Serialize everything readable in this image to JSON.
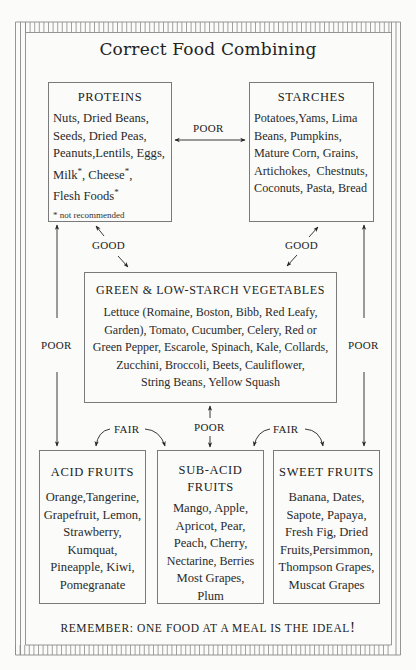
{
  "title": "Correct Food Combining",
  "groups": {
    "proteins": {
      "heading": "PROTEINS",
      "lines": [
        "Nuts, Dried Beans,",
        "Seeds, Dried Peas,",
        "Peanuts,Lentils, Eggs,"
      ],
      "starred": [
        "Milk",
        ", Cheese",
        ","
      ],
      "last": "Flesh Foods",
      "asterisk": "*",
      "note": "* not recommended"
    },
    "starches": {
      "heading": "STARCHES",
      "lines": [
        "Potatoes,Yams, Lima",
        "Beans, Pumpkins,",
        "Mature Corn, Grains,",
        "Artichokes,  Chestnuts,",
        "Coconuts, Pasta, Bread"
      ]
    },
    "vegetables": {
      "heading": "GREEN & LOW-STARCH VEGETABLES",
      "lines": [
        "Lettuce (Romaine, Boston, Bibb, Red Leafy,",
        "Garden), Tomato, Cucumber, Celery, Red or",
        "Green Pepper, Escarole, Spinach, Kale, Collards,",
        "Zucchini, Broccoli, Beets, Cauliflower,",
        "String Beans, Yellow Squash"
      ]
    },
    "acid_fruits": {
      "heading": "ACID FRUITS",
      "lines": [
        "Orange,Tangerine,",
        "Grapefruit, Lemon,",
        "Strawberry,",
        "Kumquat,",
        "Pineapple, Kiwi,",
        "Pomegranate"
      ]
    },
    "sub_acid_fruits": {
      "heading_lines": [
        "SUB-ACID",
        "FRUITS"
      ],
      "lines": [
        "Mango, Apple,",
        "Apricot, Pear,",
        "Peach, Cherry,",
        "Nectarine, Berries",
        "Most Grapes,",
        "Plum"
      ]
    },
    "sweet_fruits": {
      "heading": "SWEET FRUITS",
      "lines": [
        "Banana, Dates,",
        "Sapote, Papaya,",
        "Fresh Fig, Dried",
        "Fruits,Persimmon,",
        "Thompson Grapes,",
        "Muscat Grapes"
      ]
    }
  },
  "relations": {
    "proteins_starches": "POOR",
    "proteins_vegetables": "GOOD",
    "starches_vegetables": "GOOD",
    "proteins_acid": "POOR",
    "starches_sweet": "POOR",
    "vegetables_subacid": "POOR",
    "acid_subacid": "FAIR",
    "subacid_sweet": "FAIR"
  },
  "footer": {
    "text": "REMEMBER: ONE FOOD AT A MEAL IS THE IDEAL",
    "bang": "!"
  }
}
